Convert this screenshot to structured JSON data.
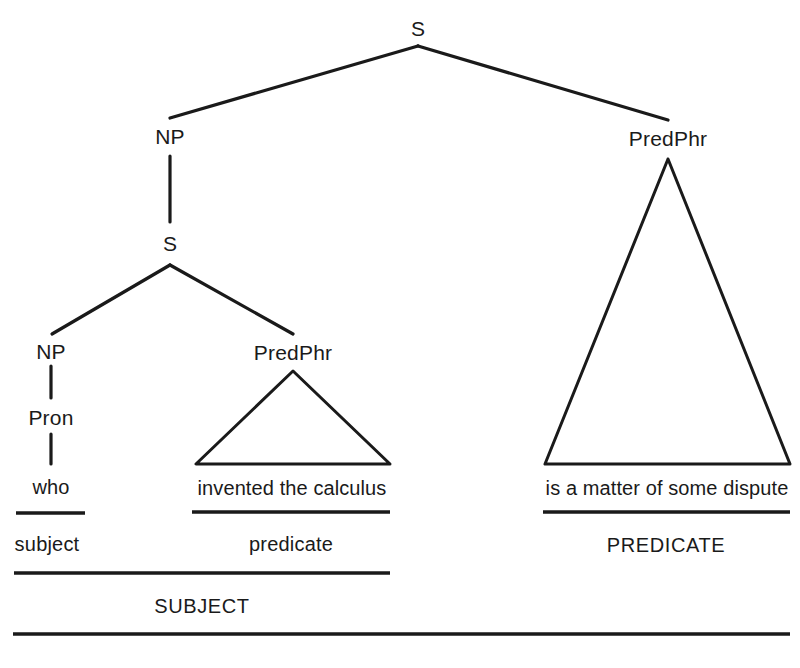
{
  "diagram": {
    "type": "syntax-tree",
    "sentence_parts": {
      "subject_clause": "who invented the calculus",
      "predicate_clause": "is a matter of some dispute"
    },
    "colors": {
      "ink": "#1a1a1a",
      "background": "#ffffff"
    }
  },
  "nodes": {
    "root_s": "S",
    "np_top": "NP",
    "predphr_top": "PredPhr",
    "s_embedded": "S",
    "np_lower": "NP",
    "pron": "Pron",
    "predphr_lower": "PredPhr"
  },
  "terminals": {
    "who": "who",
    "invented_the_calculus": "invented the calculus",
    "is_a_matter_of_some_dispute": "is a matter of some dispute"
  },
  "brackets": {
    "subject_small": "subject",
    "predicate_small": "predicate",
    "predicate_caps": "PREDICATE",
    "subject_caps": "SUBJECT"
  }
}
